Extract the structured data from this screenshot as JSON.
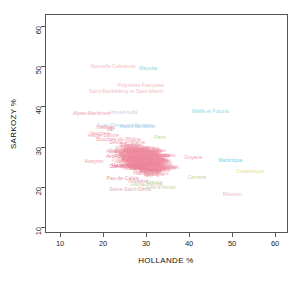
{
  "chart_data": {
    "type": "scatter",
    "title": "",
    "xlabel": "HOLLANDE %",
    "ylabel": "SARKOZY %",
    "xlim": [
      6.5,
      63
    ],
    "ylim": [
      8.5,
      63
    ],
    "xticks": [
      10,
      20,
      30,
      40,
      50,
      60
    ],
    "yticks": [
      10,
      20,
      30,
      40,
      50,
      60
    ],
    "grid": false,
    "legend": null,
    "marker_style": "text-label",
    "note": "Each point is drawn as the department/territory name instead of a marker.",
    "points": [
      {
        "label": "Nouvelle Calédonie",
        "x": 22.3,
        "y": 49.8,
        "color": "#f3bcc4",
        "size": 5.2
      },
      {
        "label": "Mayotte",
        "x": 30.5,
        "y": 49.3,
        "color": "#8fd6e8",
        "size": 5.2
      },
      {
        "label": "Polynésie Française",
        "x": 28.8,
        "y": 45.2,
        "color": "#f3bcc4",
        "size": 5.2
      },
      {
        "label": "Saint-Barthélemy et Saint-Martin",
        "x": 25.4,
        "y": 43.6,
        "color": "#f3bcc4",
        "size": 5.2
      },
      {
        "label": "Wallis et Futuna",
        "x": 44.9,
        "y": 38.6,
        "color": "#8fd6e8",
        "size": 5.2
      },
      {
        "label": "Alpes-Maritimes",
        "x": 17.3,
        "y": 38.0,
        "color": "#ee9fae",
        "size": 5.2
      },
      {
        "label": "Ahmed-sulfa",
        "x": 24.6,
        "y": 38.4,
        "color": "#c9cfe2",
        "size": 5.2
      },
      {
        "label": "Saint-Pierre-et-Miquelon",
        "x": 25.1,
        "y": 35.2,
        "color": "#bcd8ee",
        "size": 5.2
      },
      {
        "label": "Hauts-de-Seine",
        "x": 28.0,
        "y": 35.0,
        "color": "#9fd2e8",
        "size": 5.2
      },
      {
        "label": "Yvelines",
        "x": 20.5,
        "y": 34.6,
        "color": "#ee8fa4",
        "size": 5.2
      },
      {
        "label": "Var",
        "x": 21.7,
        "y": 34.2,
        "color": "#ee8fa4",
        "size": 5.2
      },
      {
        "label": "Vaucluse",
        "x": 19.4,
        "y": 33.2,
        "color": "#f0a8b6",
        "size": 5.2
      },
      {
        "label": "Haute-Savoie",
        "x": 20.1,
        "y": 32.6,
        "color": "#f0a8b6",
        "size": 5.2
      },
      {
        "label": "Paris",
        "x": 33.2,
        "y": 32.2,
        "color": "#b9e0a8",
        "size": 5.2
      },
      {
        "label": "Bouches-du-Rhône",
        "x": 23.6,
        "y": 31.6,
        "color": "#ef9cad",
        "size": 5.2
      },
      {
        "label": "Seine-et-Marne",
        "x": 25.6,
        "y": 30.9,
        "color": "#ef9cad",
        "size": 5.2
      },
      {
        "label": "Essonne",
        "x": 26.4,
        "y": 30.2,
        "color": "#ee92a6",
        "size": 5.2
      },
      {
        "label": "Val-d'Oise",
        "x": 27.9,
        "y": 29.6,
        "color": "#ee92a6",
        "size": 5.2
      },
      {
        "label": "Oise",
        "x": 24.1,
        "y": 29.4,
        "color": "#ee92a6",
        "size": 5.2
      },
      {
        "label": "Moselle",
        "x": 26.8,
        "y": 28.9,
        "color": "#ec8ba0",
        "size": 5.2
      },
      {
        "label": "Rhône",
        "x": 28.6,
        "y": 28.6,
        "color": "#ec8ba0",
        "size": 5.2
      },
      {
        "label": "Bas-Rhin",
        "x": 25.2,
        "y": 28.2,
        "color": "#ec8ba0",
        "size": 5.2
      },
      {
        "label": "Guyane",
        "x": 41.0,
        "y": 27.2,
        "color": "#f0a0b0",
        "size": 5.2
      },
      {
        "label": "Martinique",
        "x": 49.6,
        "y": 26.4,
        "color": "#77cfe6",
        "size": 5.2
      },
      {
        "label": "Ardèche",
        "x": 23.0,
        "y": 27.4,
        "color": "#ea8398",
        "size": 5.2
      },
      {
        "label": "Isère",
        "x": 27.3,
        "y": 27.1,
        "color": "#ea8398",
        "size": 5.2
      },
      {
        "label": "Loire",
        "x": 30.2,
        "y": 26.8,
        "color": "#ea8398",
        "size": 5.2
      },
      {
        "label": "Aveyron",
        "x": 17.9,
        "y": 26.2,
        "color": "#ef9cad",
        "size": 5.2
      },
      {
        "label": "Gironde",
        "x": 29.4,
        "y": 26.0,
        "color": "#ea8398",
        "size": 5.2
      },
      {
        "label": "Nord",
        "x": 31.5,
        "y": 25.6,
        "color": "#ea8398",
        "size": 5.2
      },
      {
        "label": "Haute-Garonne",
        "x": 26.1,
        "y": 25.2,
        "color": "#e87b92",
        "size": 5.2
      },
      {
        "label": "Calvados",
        "x": 24.0,
        "y": 25.0,
        "color": "#e87b92",
        "size": 5.2
      },
      {
        "label": "Guadeloupe",
        "x": 54.2,
        "y": 23.6,
        "color": "#e4e08a",
        "size": 5.2
      },
      {
        "label": "Manche",
        "x": 28.2,
        "y": 24.4,
        "color": "#e87b92",
        "size": 5.2
      },
      {
        "label": "Morbihan",
        "x": 31.0,
        "y": 24.0,
        "color": "#e87b92",
        "size": 5.2
      },
      {
        "label": "Corrèze",
        "x": 41.8,
        "y": 22.2,
        "color": "#c7cf9e",
        "size": 5.2
      },
      {
        "label": "Pas-de-Calais",
        "x": 24.6,
        "y": 22.0,
        "color": "#e89aa6",
        "size": 5.2
      },
      {
        "label": "Finistère",
        "x": 28.2,
        "y": 21.2,
        "color": "#e6a0ac",
        "size": 5.2
      },
      {
        "label": "Creuse",
        "x": 31.9,
        "y": 20.9,
        "color": "#c5d2a4",
        "size": 5.2
      },
      {
        "label": "Haute-Vienne",
        "x": 30.1,
        "y": 20.4,
        "color": "#d2cfa8",
        "size": 5.2
      },
      {
        "label": "Seine-Saint-Denis",
        "x": 26.3,
        "y": 19.1,
        "color": "#e0aeb8",
        "size": 5.2
      },
      {
        "label": "Côtes-d'Armor",
        "x": 33.0,
        "y": 19.6,
        "color": "#cbd0a6",
        "size": 5.2
      },
      {
        "label": "Réunion",
        "x": 50.1,
        "y": 17.9,
        "color": "#edb7c0",
        "size": 5.2
      }
    ],
    "cluster": {
      "description": "dense overplotted cluster of metropolitan French departments",
      "x_range": [
        20,
        37
      ],
      "y_range": [
        19,
        34
      ],
      "color": "#ef8ba1",
      "count": 340
    }
  },
  "axes": {
    "x": {
      "title": "HOLLANDE %",
      "ticks": [
        "10",
        "20",
        "30",
        "40",
        "50",
        "60"
      ]
    },
    "y": {
      "title": "SARKOZY %",
      "ticks": [
        "10",
        "20",
        "30",
        "40",
        "50",
        "60"
      ]
    }
  }
}
